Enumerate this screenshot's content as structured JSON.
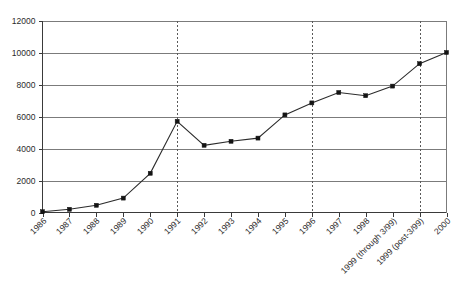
{
  "chart_data": {
    "type": "line",
    "title": "",
    "subtitle": "",
    "xlabel": "",
    "ylabel": "",
    "ylim": [
      0,
      12000
    ],
    "ytick_labels": [
      "0",
      "2000",
      "4000",
      "6000",
      "8000",
      "10000",
      "12000"
    ],
    "ytick_values": [
      0,
      2000,
      4000,
      6000,
      8000,
      10000,
      12000
    ],
    "grid": "horizontal",
    "legend": "none",
    "legend_position": "none",
    "marker": "filled-square",
    "line_color": "#2b2b2b",
    "marker_color": "#141414",
    "grid_color": "#7b7b7b",
    "axis_color": "#3a3a3a",
    "categories": [
      "1986",
      "1987",
      "1988",
      "1989",
      "1990",
      "1991",
      "1992",
      "1993",
      "1994",
      "1995",
      "1996",
      "1997",
      "1998",
      "1999 (through 3/99)",
      "1999 (post-3/99)",
      "2000"
    ],
    "values": [
      50,
      200,
      450,
      900,
      2450,
      5700,
      4200,
      4450,
      4650,
      6100,
      6850,
      7500,
      7300,
      7900,
      9300,
      10000
    ],
    "annotations": [
      {
        "type": "vertical-dashed-line",
        "at_category": "1991"
      },
      {
        "type": "vertical-dashed-line",
        "at_category": "1996"
      },
      {
        "type": "vertical-dashed-line",
        "at_category": "1999 (post-3/99)"
      }
    ]
  }
}
